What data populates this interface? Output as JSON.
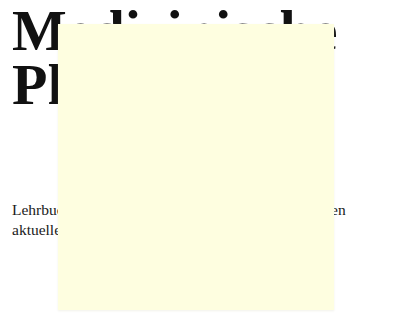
{
  "document": {
    "title_lines": [
      "Medizinische",
      "Physiologie"
    ],
    "body_lines": [
      "Lehrbuch der Physiologie für die Ausbildung und den",
      "aktuellen Stand der Forschung"
    ],
    "visible_fragments": {
      "title_line_1_left": "M",
      "title_line_1_dots": "· · ·",
      "title_line_1_right": "e",
      "title_line_2_left": "Pl",
      "body_line_1_left": "Lehrb",
      "body_line_1_right": "g und den",
      "body_line_2_left": "aktuel"
    }
  },
  "overlay": {
    "type": "sticky-note",
    "color": "#fefee0"
  }
}
